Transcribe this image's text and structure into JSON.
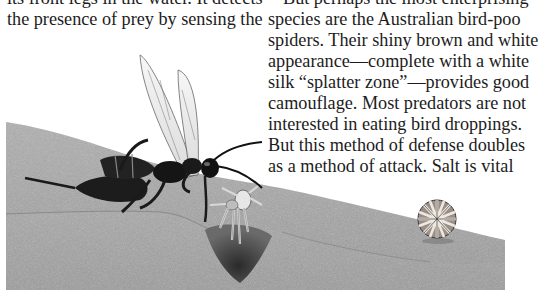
{
  "page": {
    "left_column": {
      "lines": [
        "its front legs in the water. It detects",
        "the presence of prey by sensing the"
      ]
    },
    "right_column": {
      "lines": [
        "But perhaps the most enterprising",
        "species are the Australian bird-poo",
        "spiders. Their shiny brown and white",
        "appearance—complete with a white",
        "silk “splatter zone”—provides good",
        "camouflage. Most predators are not",
        "interested in eating bird droppings.",
        "But this method of defense doubles",
        "as a method of attack. Salt is vital"
      ]
    },
    "illustration": {
      "subjects": [
        "wasp",
        "spider-caught-by-wasp",
        "burrow",
        "curled-wheel-spider",
        "sand-dune"
      ],
      "colors": {
        "sand": "#a4a4a4",
        "sand_dark": "#7c7c7c",
        "wasp_body": "#1a1a1a",
        "background": "#ffffff"
      }
    }
  }
}
